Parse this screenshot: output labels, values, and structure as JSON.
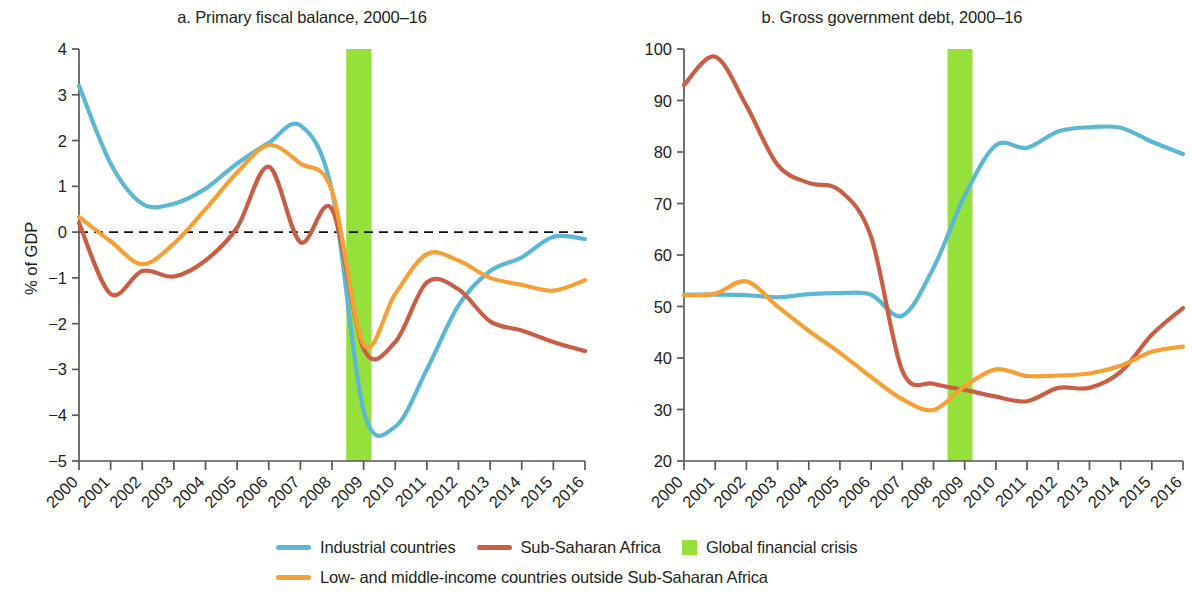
{
  "figure": {
    "ylabel": "% of GDP",
    "background": "#ffffff"
  },
  "colors": {
    "industrial": "#5bb7d4",
    "ssa": "#c85f45",
    "lmic": "#f5a037",
    "crisis_band": "#96e03c",
    "axis": "#58595b",
    "text": "#231f20"
  },
  "legend": {
    "items": [
      {
        "label": "Industrial countries",
        "type": "line",
        "color": "#5bb7d4"
      },
      {
        "label": "Sub-Saharan Africa",
        "type": "line",
        "color": "#c85f45"
      },
      {
        "label": "Global financial crisis",
        "type": "box",
        "color": "#96e03c"
      },
      {
        "label": "Low- and middle-income countries outside Sub-Saharan Africa",
        "type": "line",
        "color": "#f5a037"
      }
    ]
  },
  "chart_data": [
    {
      "type": "line",
      "panel": "a",
      "title": "a. Primary fiscal balance, 2000–16",
      "xlabel": "",
      "ylabel": "% of GDP",
      "grid": false,
      "legend_position": "bottom",
      "zero_line": 0,
      "ylim": [
        -5,
        4
      ],
      "yticks": [
        4,
        3,
        2,
        1,
        0,
        -1,
        -2,
        -3,
        -4,
        -5
      ],
      "ytick_labels": [
        "4",
        "3",
        "2",
        "1",
        "0",
        "−1",
        "−2",
        "−3",
        "−4",
        "−5"
      ],
      "x": [
        2000,
        2001,
        2002,
        2003,
        2004,
        2005,
        2006,
        2007,
        2008,
        2009,
        2010,
        2011,
        2012,
        2013,
        2014,
        2015,
        2016
      ],
      "xtick_labels": [
        "2000",
        "2001",
        "2002",
        "2003",
        "2004",
        "2005",
        "2006",
        "2007",
        "2008",
        "2009",
        "2010",
        "2011",
        "2012",
        "2013",
        "2014",
        "2015",
        "2016"
      ],
      "annotations": [
        {
          "label": "Global financial crisis",
          "type": "vspan",
          "x_start": 2008.45,
          "x_end": 2009.25,
          "color": "#96e03c"
        }
      ],
      "series": [
        {
          "name": "Industrial countries",
          "color": "#5bb7d4",
          "values": [
            3.2,
            1.5,
            0.62,
            0.62,
            0.95,
            1.5,
            1.95,
            2.33,
            0.9,
            -3.9,
            -4.25,
            -3.0,
            -1.6,
            -0.85,
            -0.55,
            -0.1,
            -0.15
          ]
        },
        {
          "name": "Sub-Saharan Africa",
          "color": "#c85f45",
          "values": [
            0.2,
            -1.35,
            -0.85,
            -0.97,
            -0.62,
            0.1,
            1.43,
            -0.22,
            0.5,
            -2.55,
            -2.4,
            -1.1,
            -1.25,
            -1.95,
            -2.15,
            -2.4,
            -2.6
          ]
        },
        {
          "name": "Low- and middle-income countries outside Sub-Saharan Africa",
          "color": "#f5a037",
          "values": [
            0.33,
            -0.2,
            -0.7,
            -0.25,
            0.5,
            1.3,
            1.9,
            1.5,
            0.9,
            -2.45,
            -1.35,
            -0.48,
            -0.62,
            -1.0,
            -1.15,
            -1.28,
            -1.05
          ]
        }
      ]
    },
    {
      "type": "line",
      "panel": "b",
      "title": "b. Gross government debt, 2000–16",
      "xlabel": "",
      "ylabel": "% of GDP",
      "grid": false,
      "legend_position": "bottom",
      "ylim": [
        20,
        100
      ],
      "yticks": [
        100,
        90,
        80,
        70,
        60,
        50,
        40,
        30,
        20
      ],
      "ytick_labels": [
        "100",
        "90",
        "80",
        "70",
        "60",
        "50",
        "40",
        "30",
        "20"
      ],
      "x": [
        2000,
        2001,
        2002,
        2003,
        2004,
        2005,
        2006,
        2007,
        2008,
        2009,
        2010,
        2011,
        2012,
        2013,
        2014,
        2015,
        2016
      ],
      "xtick_labels": [
        "2000",
        "2001",
        "2002",
        "2003",
        "2004",
        "2005",
        "2006",
        "2007",
        "2008",
        "2009",
        "2010",
        "2011",
        "2012",
        "2013",
        "2014",
        "2015",
        "2016"
      ],
      "annotations": [
        {
          "label": "Global financial crisis",
          "type": "vspan",
          "x_start": 2008.45,
          "x_end": 2009.25,
          "color": "#96e03c"
        }
      ],
      "series": [
        {
          "name": "Industrial countries",
          "color": "#5bb7d4",
          "values": [
            52.3,
            52.3,
            52.2,
            51.8,
            52.4,
            52.6,
            52.3,
            48.2,
            57.5,
            71.5,
            81.3,
            80.8,
            84.0,
            84.8,
            84.7,
            82.0,
            79.6
          ]
        },
        {
          "name": "Sub-Saharan Africa",
          "color": "#c85f45",
          "values": [
            93.0,
            98.5,
            89.0,
            77.5,
            74.0,
            72.5,
            63.5,
            37.5,
            35.0,
            33.8,
            32.5,
            31.6,
            34.2,
            34.2,
            37.3,
            44.5,
            49.7
          ]
        },
        {
          "name": "Low- and middle-income countries outside Sub-Saharan Africa",
          "color": "#f5a037",
          "values": [
            52.2,
            52.5,
            54.9,
            50.0,
            45.3,
            41.0,
            36.3,
            32.0,
            29.9,
            34.5,
            37.8,
            36.5,
            36.6,
            37.0,
            38.5,
            41.2,
            42.2
          ]
        }
      ]
    }
  ]
}
